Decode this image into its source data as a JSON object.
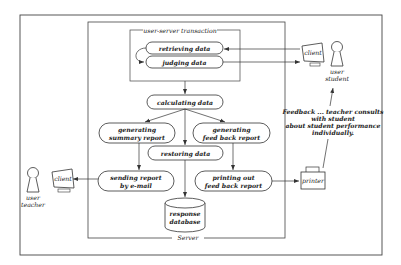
{
  "diagram": {
    "server_label": "Server",
    "transaction_label": "user-server transaction",
    "processes": {
      "retrieving": "retrieving data",
      "judging": "judging data",
      "calculating": "calculating data",
      "gen_summary_1": "generating",
      "gen_summary_2": "summary report",
      "gen_feedback_1": "generating",
      "gen_feedback_2": "feed back report",
      "restoring": "restoring data",
      "sending_1": "sending report",
      "sending_2": "by e-mail",
      "printing_1": "printing out",
      "printing_2": "feed back report"
    },
    "database": {
      "line1": "response",
      "line2": "database"
    },
    "actors": {
      "student_client": "client",
      "student_1": "user",
      "student_2": "student",
      "teacher_client": "client",
      "teacher_1": "user",
      "teacher_2": "teacher",
      "printer": "printer"
    },
    "feedback_note": {
      "line1": "Feedback ... teacher consults",
      "line2": "with student",
      "line3": "about student performance",
      "line4": "individually."
    }
  }
}
